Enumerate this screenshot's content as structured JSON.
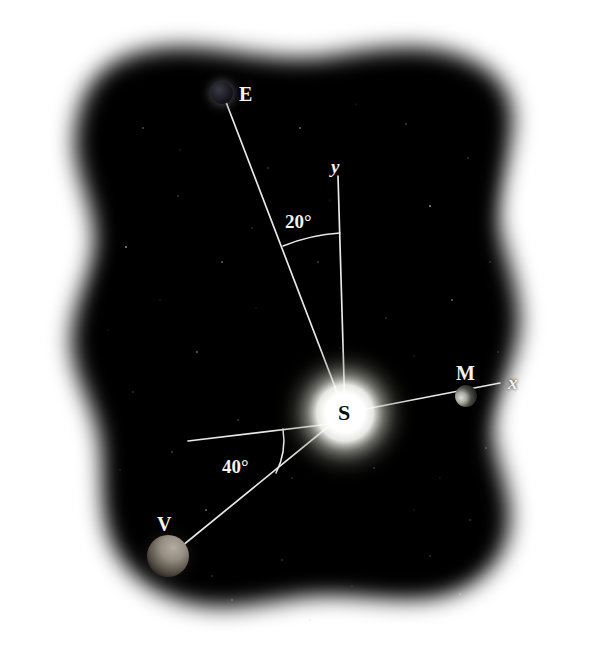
{
  "figure": {
    "background_color": "#ffffff",
    "sky_color": "#050505",
    "line_color": "#e8e8e6",
    "label_color": "#f2f2f0",
    "sun_label_color": "#0d0d0d"
  },
  "bodies": {
    "sun": {
      "label": "S",
      "name": "sun",
      "cx": 345,
      "cy": 413,
      "radius": 28,
      "glow_radius": 74,
      "color": "#ffffff"
    },
    "earth": {
      "label": "E",
      "name": "earth",
      "cx": 222,
      "cy": 93,
      "radius": 11,
      "color": "#1a1a22",
      "label_x": 239,
      "label_y": 84
    },
    "mercury": {
      "label": "M",
      "name": "mercury",
      "cx": 466,
      "cy": 396,
      "radius": 11,
      "color": "#1c1c1c",
      "label_x": 456,
      "label_y": 363
    },
    "venus": {
      "label": "V",
      "name": "venus",
      "cx": 168,
      "cy": 556,
      "radius": 21,
      "color": "#8a8278",
      "label_x": 157,
      "label_y": 514
    }
  },
  "axes": {
    "x_label": "x",
    "x_label_x": 508,
    "x_label_y": 373,
    "x_end_x": 500,
    "x_end_y": 383,
    "y_label": "y",
    "y_label_x": 331,
    "y_label_y": 157,
    "y_end_x": 338,
    "y_end_y": 176
  },
  "angles": [
    {
      "name": "earth-y-axis-angle",
      "value": "20°",
      "label_x": 285,
      "label_y": 212,
      "degrees": 20,
      "between": [
        "earth-line",
        "y-axis"
      ]
    },
    {
      "name": "venus-reference-angle",
      "value": "40°",
      "label_x": 222,
      "label_y": 457,
      "degrees": 40,
      "between": [
        "reference-line",
        "venus-line"
      ]
    }
  ],
  "reference_line": {
    "name": "horizontal-reference-line",
    "x1": 188,
    "y1": 441,
    "x2": 330,
    "y2": 424
  }
}
